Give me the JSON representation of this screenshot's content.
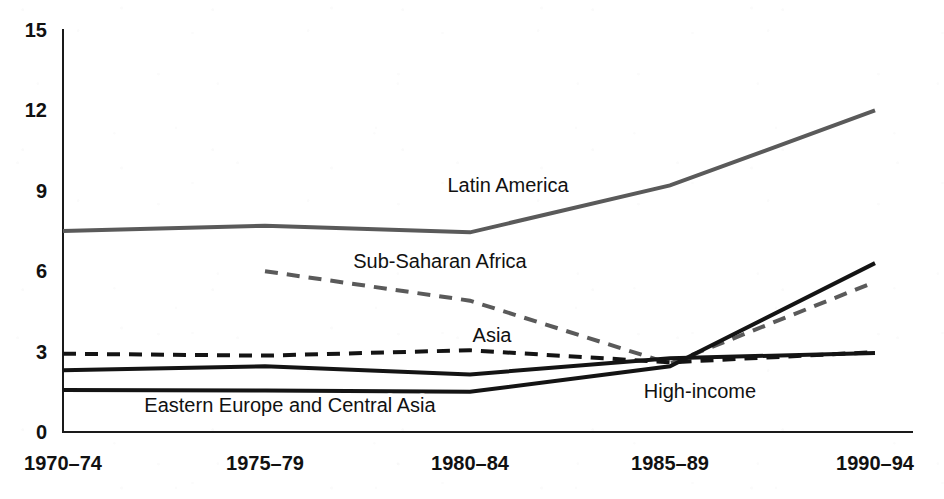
{
  "chart_data": {
    "type": "line",
    "title": "",
    "subtitle": "",
    "xlabel": "",
    "ylabel": "",
    "categories": [
      "1970–74",
      "1975–79",
      "1980–84",
      "1985–89",
      "1990–94"
    ],
    "x_tick_labels": [
      "1970–74",
      "1975–79",
      "1980–84",
      "1985–89",
      "1990–94"
    ],
    "y_tick_labels": [
      "0",
      "3",
      "6",
      "9",
      "12",
      "15"
    ],
    "y_ticks": [
      0,
      3,
      6,
      9,
      12,
      15
    ],
    "ylim": [
      0,
      15
    ],
    "grid": false,
    "legend_position": "inline-annotations",
    "series": [
      {
        "name": "Latin America",
        "label": "Latin America",
        "color": "#5a5a5a",
        "style": "solid",
        "width": 4,
        "x": [
          "1970–74",
          "1975–79",
          "1980–84",
          "1985–89",
          "1990–94"
        ],
        "values": [
          7.5,
          7.7,
          7.45,
          9.2,
          12.0
        ],
        "label_x": "1980–84",
        "label_value": 9.0
      },
      {
        "name": "Sub-Saharan Africa",
        "label": "Sub-Saharan Africa",
        "color": "#5a5a5a",
        "style": "dashed",
        "width": 4,
        "x": [
          "1975–79",
          "1980–84",
          "1985–89",
          "1990–94"
        ],
        "values": [
          6.0,
          4.9,
          2.55,
          5.6
        ],
        "label_x": "1977",
        "label_value": 6.4
      },
      {
        "name": "Asia",
        "label": "Asia",
        "color": "#141414",
        "style": "dashed",
        "width": 4,
        "x": [
          "1970–74",
          "1975–79",
          "1980–84",
          "1985–89",
          "1990–94"
        ],
        "values": [
          2.92,
          2.85,
          3.05,
          2.6,
          2.98
        ],
        "label_x": "1982",
        "label_value": 3.55
      },
      {
        "name": "High-income",
        "label": "High-income",
        "color": "#141414",
        "style": "solid",
        "width": 4,
        "x": [
          "1970–74",
          "1975–79",
          "1980–84",
          "1985–89",
          "1990–94"
        ],
        "values": [
          2.3,
          2.45,
          2.15,
          2.75,
          2.95
        ],
        "label_x": "1987",
        "label_value": 1.55
      },
      {
        "name": "Eastern Europe and Central Asia",
        "label": "Eastern Europe and Central Asia",
        "color": "#141414",
        "style": "solid",
        "width": 4,
        "x": [
          "1970–74",
          "1975–79",
          "1980–84",
          "1985–89",
          "1990–94"
        ],
        "values": [
          1.57,
          1.55,
          1.5,
          2.45,
          6.3
        ],
        "label_x": "1974",
        "label_value": 1.05
      }
    ],
    "annotations": [
      {
        "text": "Latin America",
        "x_px": 508,
        "y_px": 192
      },
      {
        "text": "Sub-Saharan Africa",
        "x_px": 440,
        "y_px": 268
      },
      {
        "text": "Asia",
        "x_px": 492,
        "y_px": 342
      },
      {
        "text": "High-income",
        "x_px": 700,
        "y_px": 398
      },
      {
        "text": "Eastern Europe and Central Asia",
        "x_px": 290,
        "y_px": 412
      }
    ]
  }
}
